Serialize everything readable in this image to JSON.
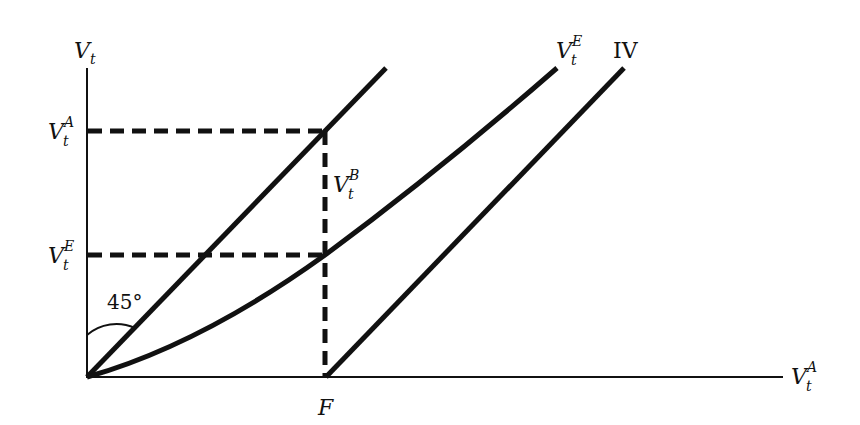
{
  "diagram": {
    "y_axis_label": {
      "base": "V",
      "sub": "t"
    },
    "x_axis_label": {
      "base": "V",
      "sub": "t",
      "sup": "A"
    },
    "y_ticks": [
      {
        "base": "V",
        "sub": "t",
        "sup": "A"
      },
      {
        "base": "V",
        "sub": "t",
        "sup": "E"
      }
    ],
    "x_tick": "F",
    "gap_label": {
      "base": "V",
      "sub": "t",
      "sup": "B"
    },
    "curve_labels": {
      "curve_ve": {
        "base": "V",
        "sub": "t",
        "sup": "E"
      },
      "line_iv": "IV"
    },
    "angle_label": "45°",
    "stroke_color": "#111111",
    "background": "#ffffff"
  }
}
